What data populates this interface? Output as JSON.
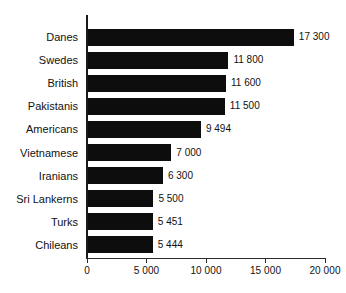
{
  "chart_data": {
    "type": "bar",
    "orientation": "horizontal",
    "title": "",
    "subtitle": "",
    "xlabel": "",
    "ylabel": "",
    "xlim": [
      0,
      20000
    ],
    "grid": false,
    "legend": null,
    "categories": [
      "Danes",
      "Swedes",
      "British",
      "Pakistanis",
      "Americans",
      "Vietnamese",
      "Iranians",
      "Sri Lankerns",
      "Turks",
      "Chileans"
    ],
    "values": [
      17300,
      11800,
      11600,
      11500,
      9494,
      7000,
      6300,
      5500,
      5451,
      5444
    ],
    "value_labels": [
      "17 300",
      "11 800",
      "11 600",
      "11 500",
      "9 494",
      "7 000",
      "6 300",
      "5 500",
      "5 451",
      "5 444"
    ],
    "xticks": [
      0,
      5000,
      10000,
      15000,
      20000
    ],
    "xtick_labels": [
      "0",
      "5 000",
      "10 000",
      "15 000",
      "20 000"
    ],
    "bar_color": "#0d0d0d",
    "axis_color": "#1a1a1a",
    "background_color": "#ffffff",
    "rows": [
      {
        "label": "Danes",
        "value": 17300,
        "value_label": "17 300"
      },
      {
        "label": "Swedes",
        "value": 11800,
        "value_label": "11 800"
      },
      {
        "label": "British",
        "value": 11600,
        "value_label": "11 600"
      },
      {
        "label": "Pakistanis",
        "value": 11500,
        "value_label": "11 500"
      },
      {
        "label": "Americans",
        "value": 9494,
        "value_label": "9 494"
      },
      {
        "label": "Vietnamese",
        "value": 7000,
        "value_label": "7 000"
      },
      {
        "label": "Iranians",
        "value": 6300,
        "value_label": "6 300"
      },
      {
        "label": "Sri Lankerns",
        "value": 5500,
        "value_label": "5 500"
      },
      {
        "label": "Turks",
        "value": 5451,
        "value_label": "5 451"
      },
      {
        "label": "Chileans",
        "value": 5444,
        "value_label": "5 444"
      }
    ]
  }
}
